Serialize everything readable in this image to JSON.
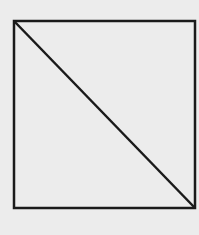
{
  "diagram": {
    "type": "square-with-diagonal",
    "background_color": "#ececec",
    "stroke_color": "#1a1a1a",
    "stroke_width": 2.5,
    "square": {
      "x": 14,
      "y": 21,
      "width": 181,
      "height": 187
    },
    "diagonal": {
      "x1": 14,
      "y1": 21,
      "x2": 195,
      "y2": 208
    }
  }
}
